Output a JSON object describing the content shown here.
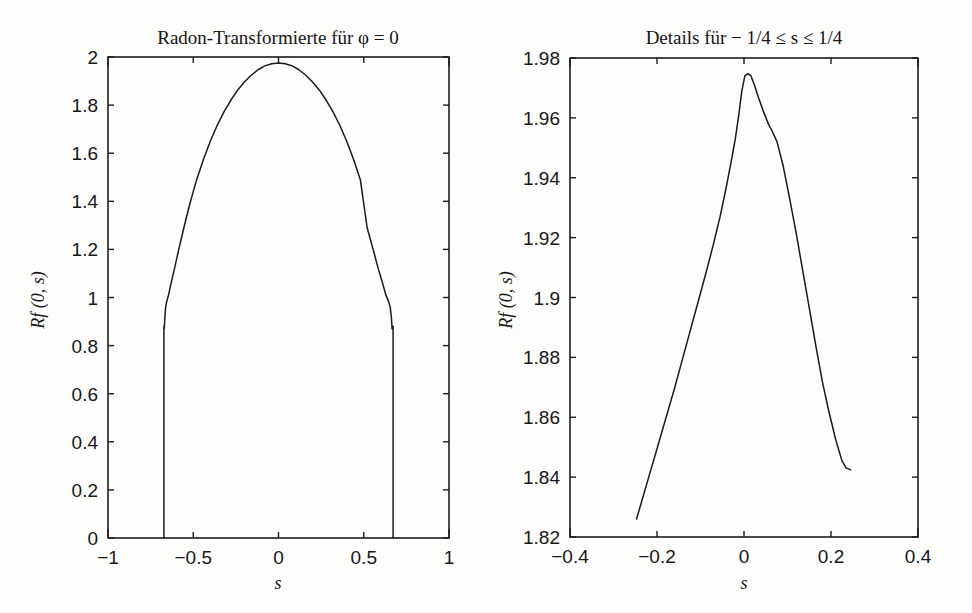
{
  "figure": {
    "background_color": "#fdfdfc",
    "ink_color": "#1a1a1a",
    "width": 972,
    "height": 613
  },
  "chart_data": [
    {
      "id": "left",
      "type": "line",
      "title": "Radon-Transformierte für  φ = 0",
      "title_parts": {
        "main": "Radon-Transformierte für",
        "symbol": "φ",
        "equals": "= 0"
      },
      "xlabel": "s",
      "ylabel": "Rf (0, s)",
      "xlim": [
        -1,
        1
      ],
      "ylim": [
        0,
        2
      ],
      "xticks": [
        -1,
        -0.5,
        0,
        0.5,
        1
      ],
      "xticklabels": [
        "−1",
        "−0.5",
        "0",
        "0.5",
        "1"
      ],
      "yticks": [
        0,
        0.2,
        0.4,
        0.6,
        0.8,
        1,
        1.2,
        1.4,
        1.6,
        1.8,
        2
      ],
      "yticklabels": [
        "0",
        "0.2",
        "0.4",
        "0.6",
        "0.8",
        "1",
        "1.2",
        "1.4",
        "1.6",
        "1.8",
        "2"
      ],
      "grid": false,
      "legend": "none",
      "series": [
        {
          "name": "Rf(0,s)",
          "color": "#1a1a1a",
          "x": [
            -0.672,
            -0.672,
            -0.672,
            -0.67,
            -0.666,
            -0.662,
            -0.655,
            -0.645,
            -0.63,
            -0.61,
            -0.585,
            -0.555,
            -0.52,
            -0.48,
            -0.44,
            -0.4,
            -0.36,
            -0.32,
            -0.28,
            -0.24,
            -0.2,
            -0.16,
            -0.12,
            -0.08,
            -0.04,
            0.0,
            0.04,
            0.08,
            0.12,
            0.16,
            0.2,
            0.24,
            0.28,
            0.32,
            0.36,
            0.4,
            0.44,
            0.48,
            0.52,
            0.555,
            0.585,
            0.61,
            0.63,
            0.645,
            0.655,
            0.662,
            0.666,
            0.67,
            0.672,
            0.672,
            0.672
          ],
          "y": [
            0.0,
            0.46,
            0.88,
            0.87,
            0.92,
            0.96,
            0.985,
            1.01,
            1.06,
            1.12,
            1.2,
            1.29,
            1.39,
            1.49,
            1.575,
            1.65,
            1.715,
            1.772,
            1.82,
            1.862,
            1.896,
            1.924,
            1.947,
            1.963,
            1.972,
            1.975,
            1.972,
            1.963,
            1.947,
            1.924,
            1.896,
            1.862,
            1.82,
            1.772,
            1.715,
            1.65,
            1.575,
            1.49,
            1.29,
            1.2,
            1.12,
            1.06,
            1.01,
            0.985,
            0.96,
            0.92,
            0.87,
            0.88,
            0.88,
            0.46,
            0.0
          ]
        }
      ],
      "features": {
        "peak_value": 1.975,
        "peak_x": 0.0,
        "support_edges": [
          -0.672,
          0.672
        ],
        "edge_notch_value": 0.88,
        "drop_to_zero": true
      }
    },
    {
      "id": "right",
      "type": "line",
      "title": "Details für − 1/4 ≤ s ≤ 1/4",
      "title_parts": {
        "main": "Details f ür",
        "range": "− 1/4 ≤ s ≤ 1/4"
      },
      "xlabel": "s",
      "ylabel": "Rf (0, s)",
      "xlim": [
        -0.4,
        0.4
      ],
      "ylim": [
        1.82,
        1.98
      ],
      "xticks": [
        -0.4,
        -0.2,
        0,
        0.2,
        0.4
      ],
      "xticklabels": [
        "−0.4",
        "−0.2",
        "0",
        "0.2",
        "0.4"
      ],
      "yticks": [
        1.82,
        1.84,
        1.86,
        1.88,
        1.9,
        1.92,
        1.94,
        1.96,
        1.98
      ],
      "yticklabels": [
        "1.82",
        "1.84",
        "1.86",
        "1.88",
        "1.9",
        "1.92",
        "1.94",
        "1.96",
        "1.98"
      ],
      "grid": false,
      "legend": "none",
      "series": [
        {
          "name": "Rf(0,s)",
          "color": "#1a1a1a",
          "x": [
            -0.247,
            -0.235,
            -0.22,
            -0.205,
            -0.19,
            -0.175,
            -0.16,
            -0.145,
            -0.13,
            -0.115,
            -0.1,
            -0.085,
            -0.07,
            -0.055,
            -0.042,
            -0.03,
            -0.02,
            -0.012,
            -0.005,
            0.002,
            0.009,
            0.016,
            0.024,
            0.034,
            0.045,
            0.056,
            0.066,
            0.076,
            0.09,
            0.105,
            0.12,
            0.135,
            0.15,
            0.165,
            0.18,
            0.195,
            0.21,
            0.225,
            0.235,
            0.245
          ],
          "y": [
            1.826,
            1.832,
            1.8395,
            1.847,
            1.8545,
            1.862,
            1.8695,
            1.8775,
            1.8855,
            1.8935,
            1.9015,
            1.9095,
            1.918,
            1.927,
            1.936,
            1.945,
            1.953,
            1.961,
            1.969,
            1.974,
            1.9748,
            1.974,
            1.971,
            1.9665,
            1.962,
            1.958,
            1.9552,
            1.952,
            1.944,
            1.933,
            1.9215,
            1.909,
            1.8965,
            1.884,
            1.872,
            1.862,
            1.853,
            1.8455,
            1.843,
            1.8425
          ]
        }
      ],
      "features": {
        "peak_value": 1.9748,
        "peak_x": 0.009,
        "left_endpoint": [
          -0.247,
          1.826
        ],
        "right_endpoint": [
          0.245,
          1.8425
        ],
        "kink_x": 0.066
      }
    }
  ]
}
